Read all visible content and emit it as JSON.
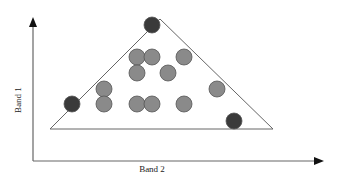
{
  "diagram": {
    "axes": {
      "x_label": "Band 2",
      "y_label": "Band 1",
      "color": "#555555"
    },
    "triangle": {
      "apex": [
        160,
        19
      ],
      "bottom_left": [
        50,
        129
      ],
      "bottom_right": [
        273,
        129
      ],
      "stroke": "#666666"
    },
    "colors": {
      "endmember": "#3a3a3a",
      "pixel": "#8a8a8a",
      "outline": "#555555"
    },
    "endmembers": [
      {
        "x": 152,
        "y": 25
      },
      {
        "x": 72,
        "y": 104
      },
      {
        "x": 234,
        "y": 121
      }
    ],
    "pixels": [
      {
        "x": 137,
        "y": 57
      },
      {
        "x": 152,
        "y": 57
      },
      {
        "x": 184,
        "y": 57
      },
      {
        "x": 137,
        "y": 73
      },
      {
        "x": 168,
        "y": 73
      },
      {
        "x": 104,
        "y": 89
      },
      {
        "x": 217,
        "y": 89
      },
      {
        "x": 104,
        "y": 104
      },
      {
        "x": 137,
        "y": 104
      },
      {
        "x": 152,
        "y": 104
      },
      {
        "x": 184,
        "y": 104
      }
    ]
  }
}
